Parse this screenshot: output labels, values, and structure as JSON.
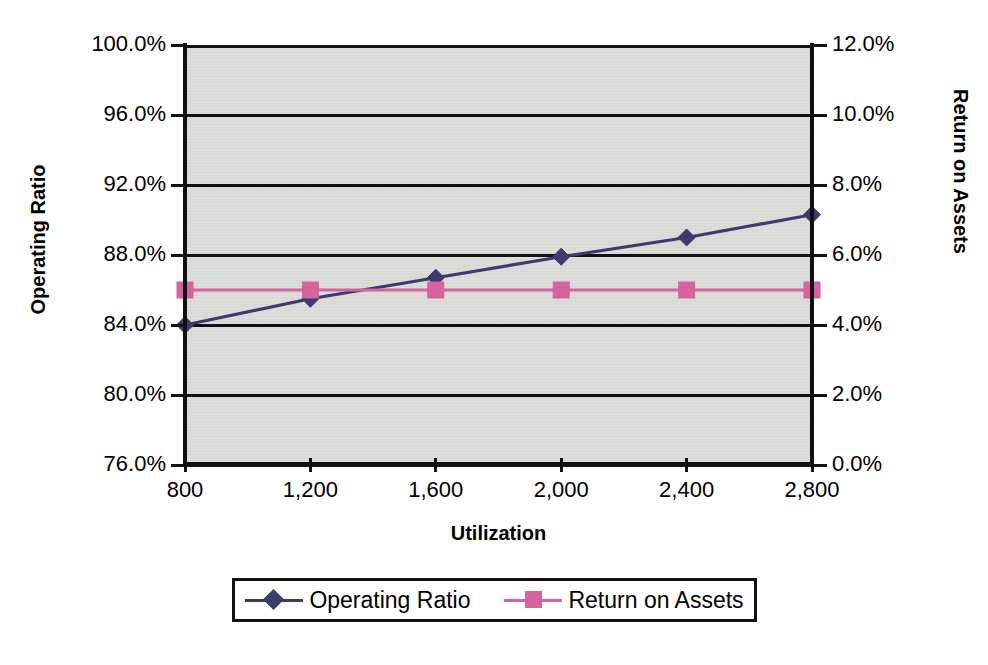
{
  "chart_data": {
    "type": "line",
    "title": "",
    "subtitle": "",
    "xlabel": "Utilization",
    "ylabel": "Operating Ratio",
    "y2label": "Return on Assets",
    "x": [
      800,
      1200,
      1600,
      2000,
      2400,
      2800
    ],
    "xtick_labels": [
      "800",
      "1,200",
      "1,600",
      "2,000",
      "2,400",
      "2,800"
    ],
    "xlim": [
      800,
      2800
    ],
    "ylim": [
      76,
      100
    ],
    "ytick_labels": [
      "100.0%",
      "96.0%",
      "92.0%",
      "88.0%",
      "84.0%",
      "80.0%",
      "76.0%"
    ],
    "ytick_values": [
      100,
      96,
      92,
      88,
      84,
      80,
      76
    ],
    "y2lim": [
      0,
      12
    ],
    "y2tick_labels": [
      "12.0%",
      "10.0%",
      "8.0%",
      "6.0%",
      "4.0%",
      "2.0%",
      "0.0%"
    ],
    "y2tick_values": [
      12,
      10,
      8,
      6,
      4,
      2,
      0
    ],
    "grid": true,
    "grid_axis": "y",
    "legend_position": "bottom",
    "plot_background": "#d9dcd6",
    "series": [
      {
        "name": "Operating Ratio",
        "axis": "left",
        "color": "#3b3b6d",
        "marker": "diamond",
        "values": [
          84.0,
          85.5,
          86.7,
          87.9,
          89.0,
          90.3
        ]
      },
      {
        "name": "Return on Assets",
        "axis": "right",
        "color": "#d4639e",
        "marker": "square",
        "values": [
          5.0,
          5.0,
          5.0,
          5.0,
          5.0,
          5.0
        ]
      }
    ]
  },
  "legend": {
    "entries": [
      {
        "label": "Operating Ratio"
      },
      {
        "label": "Return on Assets"
      }
    ]
  }
}
